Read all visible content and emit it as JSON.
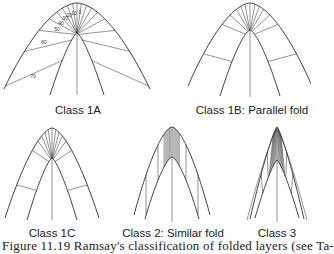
{
  "figure": {
    "caption": "Figure 11.19  Ramsay's classification of folded layers (see Ta-",
    "panels": [
      {
        "id": "1A",
        "label": "Class 1A",
        "isogon_labels": [
          "0",
          "10",
          "20",
          "30",
          "40",
          "50",
          "60",
          "70"
        ]
      },
      {
        "id": "1B",
        "label": "Class 1B: Parallel fold"
      },
      {
        "id": "1C",
        "label": "Class 1C"
      },
      {
        "id": "2",
        "label": "Class 2: Similar fold"
      },
      {
        "id": "3",
        "label": "Class 3"
      }
    ]
  },
  "colors": {
    "line": "#2a2a2a",
    "background": "#ffffff"
  }
}
